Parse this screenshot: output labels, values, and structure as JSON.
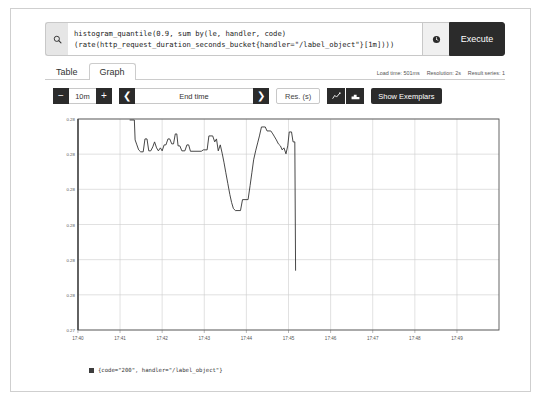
{
  "window": {
    "title": "Prometheus Graph"
  },
  "query": {
    "search_icon": "search-icon",
    "expression_line1": "histogram_quantile(0.9, sum by(le, handler, code)",
    "expression_line2": "(rate(http_request_duration_seconds_bucket{handler=\"/label_object\"}[1m])))",
    "history_icon": "clock-history-icon",
    "execute_label": "Execute"
  },
  "tabs": [
    {
      "label": "Table",
      "active": false
    },
    {
      "label": "Graph",
      "active": true
    }
  ],
  "stats": {
    "load_time": "Load time: 501ms",
    "resolution": "Resolution: 2s",
    "result_series": "Result series: 1"
  },
  "toolbar": {
    "decrease_label": "−",
    "range_value": "10m",
    "increase_label": "+",
    "prev_label": "❮",
    "end_time_value": "End time",
    "next_label": "❯",
    "resolution_label": "Res. (s)",
    "line_chart_icon": "line-chart-icon",
    "stacked_chart_icon": "stacked-chart-icon",
    "exemplars_label": "Show Exemplars"
  },
  "legend": {
    "swatch_color": "#3d3d3d",
    "label": "{code=\"200\", handler=\"/label_object\"}"
  },
  "colors": {
    "accent_dark": "#2b2b2b",
    "line": "#333333",
    "grid": "#cccccc",
    "axis": "#555555"
  },
  "chart_data": {
    "type": "line",
    "title": "",
    "xlabel": "",
    "ylabel": "",
    "grid": true,
    "legend_position": "bottom",
    "x_ticks": [
      "17:40",
      "17:41",
      "17:42",
      "17:43",
      "17:44",
      "17:45",
      "17:46",
      "17:47",
      "17:48",
      "17:49"
    ],
    "y_ticks": [
      "0.28",
      "0.28",
      "0.28",
      "0.28",
      "0.28",
      "0.28",
      "0.27"
    ],
    "ylim": [
      0.27,
      0.2806
    ],
    "xlim": [
      17.6667,
      17.8333
    ],
    "series": [
      {
        "name": "{code=\"200\", handler=\"/label_object\"}",
        "color": "#333333",
        "points": [
          [
            17.6873,
            0.28055
          ],
          [
            17.689,
            0.28055
          ],
          [
            17.6893,
            0.27955
          ],
          [
            17.69,
            0.2793
          ],
          [
            17.6907,
            0.27905
          ],
          [
            17.6915,
            0.27895
          ],
          [
            17.6925,
            0.27895
          ],
          [
            17.6932,
            0.2796
          ],
          [
            17.694,
            0.2796
          ],
          [
            17.6947,
            0.279
          ],
          [
            17.6955,
            0.279
          ],
          [
            17.6963,
            0.2792
          ],
          [
            17.697,
            0.27945
          ],
          [
            17.6978,
            0.27915
          ],
          [
            17.6985,
            0.279
          ],
          [
            17.6993,
            0.27915
          ],
          [
            17.7,
            0.279
          ],
          [
            17.7008,
            0.2793
          ],
          [
            17.7015,
            0.2793
          ],
          [
            17.7023,
            0.2796
          ],
          [
            17.703,
            0.2796
          ],
          [
            17.7038,
            0.27935
          ],
          [
            17.7045,
            0.27935
          ],
          [
            17.7052,
            0.27985
          ],
          [
            17.7058,
            0.27985
          ],
          [
            17.7063,
            0.27925
          ],
          [
            17.707,
            0.27925
          ],
          [
            17.7078,
            0.279
          ],
          [
            17.709,
            0.279
          ],
          [
            17.7098,
            0.2793
          ],
          [
            17.7105,
            0.2793
          ],
          [
            17.7112,
            0.27898
          ],
          [
            17.7155,
            0.27898
          ],
          [
            17.7163,
            0.27905
          ],
          [
            17.7178,
            0.27905
          ],
          [
            17.7185,
            0.27975
          ],
          [
            17.72,
            0.27975
          ],
          [
            17.7208,
            0.27945
          ],
          [
            17.7215,
            0.2796
          ],
          [
            17.7222,
            0.279
          ],
          [
            17.723,
            0.2793
          ],
          [
            17.7238,
            0.27885
          ],
          [
            17.7245,
            0.2784
          ],
          [
            17.7252,
            0.2779
          ],
          [
            17.726,
            0.27735
          ],
          [
            17.7268,
            0.2768
          ],
          [
            17.7275,
            0.2764
          ],
          [
            17.7282,
            0.2761
          ],
          [
            17.729,
            0.276
          ],
          [
            17.731,
            0.276
          ],
          [
            17.7318,
            0.27655
          ],
          [
            17.734,
            0.27655
          ],
          [
            17.7348,
            0.27725
          ],
          [
            17.7355,
            0.2779
          ],
          [
            17.7362,
            0.27855
          ],
          [
            17.737,
            0.279
          ],
          [
            17.7378,
            0.2794
          ],
          [
            17.7385,
            0.27975
          ],
          [
            17.7393,
            0.2802
          ],
          [
            17.7408,
            0.2802
          ],
          [
            17.7415,
            0.28
          ],
          [
            17.743,
            0.28
          ],
          [
            17.7438,
            0.27985
          ],
          [
            17.7445,
            0.2797
          ],
          [
            17.7452,
            0.27955
          ],
          [
            17.746,
            0.27935
          ],
          [
            17.7468,
            0.27925
          ],
          [
            17.7475,
            0.27905
          ],
          [
            17.7482,
            0.27915
          ],
          [
            17.749,
            0.27885
          ],
          [
            17.7497,
            0.27925
          ],
          [
            17.7503,
            0.27995
          ],
          [
            17.7512,
            0.27995
          ],
          [
            17.7518,
            0.27945
          ],
          [
            17.7525,
            0.27945
          ],
          [
            17.7528,
            0.273
          ]
        ]
      }
    ]
  }
}
